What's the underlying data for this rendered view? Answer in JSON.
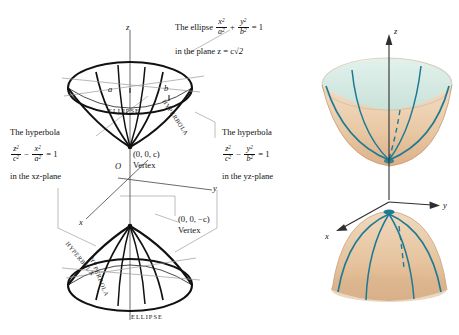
{
  "figure": {
    "title_visible": false,
    "left_diagram": {
      "name": "elliptic-cone-labeled-line-drawing",
      "axes": {
        "z": "z",
        "y": "y",
        "x": "x",
        "origin": "O"
      },
      "semi_axis_a": "a",
      "semi_axis_b": "b",
      "callouts": {
        "ellipse": {
          "line1_prefix": "The ellipse",
          "eq_num1": "x",
          "eq_den1": "a",
          "eq_num2": "y",
          "eq_den2": "b",
          "eq_plus": "+",
          "eq_equals": "= 1",
          "line2": "in the plane z = c",
          "radical": "√2"
        },
        "hyperbola_xz": {
          "line1": "The hyperbola",
          "eq_num1": "z",
          "eq_den1": "c",
          "eq_num2": "x",
          "eq_den2": "a",
          "eq_minus": "−",
          "eq_equals": "= 1",
          "line3": "in the xz-plane"
        },
        "hyperbola_yz": {
          "line1": "The hyperbola",
          "eq_num1": "z",
          "eq_den1": "c",
          "eq_num2": "y",
          "eq_den2": "b",
          "eq_minus": "−",
          "eq_equals": "= 1",
          "line3": "in the yz-plane"
        }
      },
      "vertices": [
        {
          "coord": "(0, 0, c)",
          "label": "Vertex"
        },
        {
          "coord": "(0, 0, −c)",
          "label": "Vertex"
        }
      ],
      "curve_labels": {
        "ellipse_top": "ELLIPSE",
        "ellipse_bottom": "ELLIPSE",
        "hyperbola_upper_right": "HYPERBOLA",
        "hyperbola_lower_left": "HYPERBOLA",
        "hyperbola_lower_mid": "HYPERBOLA"
      }
    },
    "right_diagram": {
      "name": "elliptic-cone-shaded-render",
      "axes": {
        "z": "z",
        "y": "y",
        "x": "x"
      }
    },
    "colors": {
      "ink": "#111111",
      "leader_line": "#9a9a9a",
      "surface_interior": "#d7ebe4",
      "surface_exterior": "#e9c9a6",
      "surface_exterior_dark": "#d9ad83",
      "trace_curve": "#1c7a93",
      "axis": "#3a3a3a"
    }
  }
}
